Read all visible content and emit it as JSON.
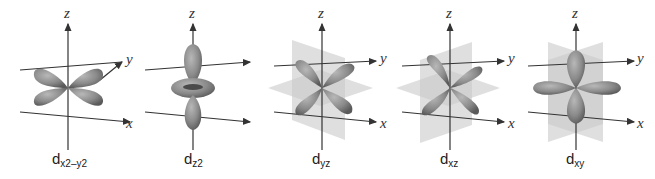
{
  "colors": {
    "lobe": "#8a8a8a",
    "lobe_dark": "#5e5e5e",
    "lobe_light": "#b5b5b5",
    "plane": "#c9c9c9",
    "axis": "#333333",
    "background": "#ffffff"
  },
  "axes": {
    "x": "x",
    "y": "y",
    "z": "z"
  },
  "orbitals": [
    {
      "id": "dx2-y2",
      "base": "d",
      "sub": "x2–y2"
    },
    {
      "id": "dz2",
      "base": "d",
      "sub": "z2"
    },
    {
      "id": "dyz",
      "base": "d",
      "sub": "yz"
    },
    {
      "id": "dxz",
      "base": "d",
      "sub": "xz"
    },
    {
      "id": "dxy",
      "base": "d",
      "sub": "xy"
    }
  ]
}
